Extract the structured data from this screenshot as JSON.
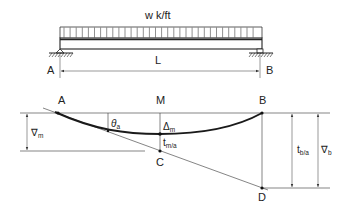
{
  "figure": {
    "type": "beam-deflection-diagram",
    "beam_diagram": {
      "load_label": "w k/ft",
      "span_label": "L",
      "left_support_label": "A",
      "right_support_label": "B",
      "load_type": "uniformly distributed"
    },
    "deflection_diagram": {
      "point_labels": {
        "a": "A",
        "m": "M",
        "b": "B",
        "c": "C",
        "d": "D"
      },
      "theta": {
        "symbol": "θ",
        "sub": "a"
      },
      "delta_m": {
        "symbol": "Δ",
        "sub": "m"
      },
      "t_ma": {
        "symbol": "t",
        "sub": "m/a"
      },
      "t_ba": {
        "symbol": "t",
        "sub": "b/a"
      },
      "nabla_m": {
        "symbol": "∇",
        "sub": "m"
      },
      "nabla_b": {
        "symbol": "∇",
        "sub": "b"
      }
    }
  }
}
